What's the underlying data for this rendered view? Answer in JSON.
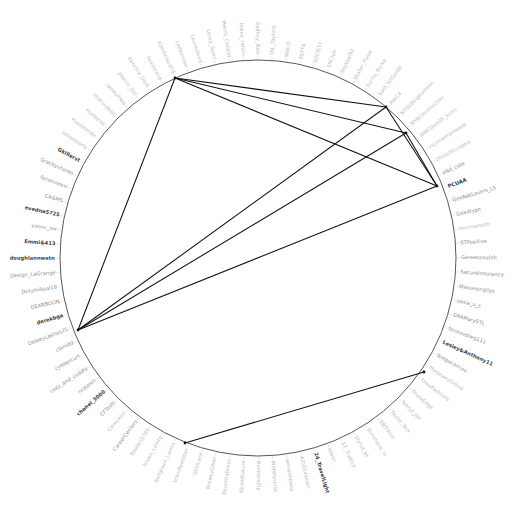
{
  "figure": {
    "type": "circular-network-graph",
    "title": "",
    "center_x": 258,
    "center_y": 258,
    "radius": 198,
    "label_radius": 203,
    "background_color": "#ffffff",
    "ring_color": "#444444",
    "edge_color": "#111111",
    "label_color_faint": "#b9b9b9",
    "label_color_mid": "#8d8d8d",
    "label_color_dark": "#3a3a3a"
  },
  "chart_data": {
    "type": "scatter",
    "title": "",
    "xlabel": "",
    "ylabel": "",
    "layout": "circular node-link diagram with radial node labels",
    "node_count": 88,
    "nodes": [
      {
        "id": 0,
        "label": "TAL_TaylorS",
        "tone": "faint"
      },
      {
        "id": 1,
        "label": "Watch",
        "tone": "faint"
      },
      {
        "id": 2,
        "label": "SOFFA",
        "tone": "faint"
      },
      {
        "id": 3,
        "label": "SOCIETY",
        "tone": "faint"
      },
      {
        "id": 4,
        "label": "SNClub",
        "tone": "faint"
      },
      {
        "id": 5,
        "label": "SkyVaal82",
        "tone": "faint"
      },
      {
        "id": 6,
        "label": "Skater_Pulse",
        "tone": "faint"
      },
      {
        "id": 7,
        "label": "Sarita_Burke",
        "tone": "faint"
      },
      {
        "id": 8,
        "label": "Sam_LOGuide",
        "tone": "faint"
      },
      {
        "id": 9,
        "label": "RWC4",
        "tone": "faint"
      },
      {
        "id": 10,
        "label": "NYSSBinghamton",
        "tone": "faint"
      },
      {
        "id": 11,
        "label": "NYKConstruction",
        "tone": "faint"
      },
      {
        "id": 12,
        "label": "NWCGenith_ksrrs",
        "tone": "faint"
      },
      {
        "id": 13,
        "label": "incomekramwest",
        "tone": "faint"
      },
      {
        "id": 14,
        "label": "OhGolfGuilders",
        "tone": "faint"
      },
      {
        "id": 15,
        "label": "aNd_cute",
        "tone": "mid"
      },
      {
        "id": 16,
        "label": "PCUAA",
        "tone": "dark"
      },
      {
        "id": 17,
        "label": "GeeNatLovers_L5",
        "tone": "mid"
      },
      {
        "id": 18,
        "label": "Geadtypn",
        "tone": "mid"
      },
      {
        "id": 19,
        "label": "mrcrownshlr",
        "tone": "faint"
      },
      {
        "id": 20,
        "label": "STPositive",
        "tone": "mid"
      },
      {
        "id": 21,
        "label": "Gereespayjob",
        "tone": "mid"
      },
      {
        "id": 22,
        "label": "SecureInsurance",
        "tone": "mid"
      },
      {
        "id": 23,
        "label": "Massevingllys",
        "tone": "mid"
      },
      {
        "id": 24,
        "label": "sonia_u_s",
        "tone": "mid"
      },
      {
        "id": 25,
        "label": "GRAMarySTL",
        "tone": "mid"
      },
      {
        "id": 26,
        "label": "formsvdlwg111",
        "tone": "mid"
      },
      {
        "id": 27,
        "label": "Lesley&Anthony11",
        "tone": "dark"
      },
      {
        "id": 28,
        "label": "Temperances",
        "tone": "mid"
      },
      {
        "id": 29,
        "label": "TheseaeyGroup",
        "tone": "faint"
      },
      {
        "id": 30,
        "label": "TheeFashions",
        "tone": "faint"
      },
      {
        "id": 31,
        "label": "ThalaEdge",
        "tone": "faint"
      },
      {
        "id": 32,
        "label": "Tehryl_Jan",
        "tone": "faint"
      },
      {
        "id": 33,
        "label": "Taylor_Bux",
        "tone": "faint"
      },
      {
        "id": 34,
        "label": "SWTdsss",
        "tone": "faint"
      },
      {
        "id": 35,
        "label": "Sunshyne_ts",
        "tone": "faint"
      },
      {
        "id": 36,
        "label": "Stylist_bt",
        "tone": "faint"
      },
      {
        "id": 37,
        "label": "ST_Traffick",
        "tone": "faint"
      },
      {
        "id": 38,
        "label": "ssbsn_",
        "tone": "faint"
      },
      {
        "id": 39,
        "label": "24_TravelLight",
        "tone": "dark"
      },
      {
        "id": 40,
        "label": "AZsOutwhen",
        "tone": "faint"
      },
      {
        "id": 41,
        "label": "wevenflowss",
        "tone": "faint"
      },
      {
        "id": 42,
        "label": "WSMPeterSt",
        "tone": "faint"
      },
      {
        "id": 43,
        "label": "BelmoreZip",
        "tone": "faint"
      },
      {
        "id": 44,
        "label": "BirdieNature",
        "tone": "faint"
      },
      {
        "id": 45,
        "label": "BlueVitaDress",
        "tone": "faint"
      },
      {
        "id": 46,
        "label": "BrewsyOlson",
        "tone": "faint"
      },
      {
        "id": 47,
        "label": "GlitzLara",
        "tone": "faint"
      },
      {
        "id": 48,
        "label": "brandlywilden",
        "tone": "faint"
      },
      {
        "id": 49,
        "label": "Bellgreen_Lamto",
        "tone": "faint"
      },
      {
        "id": 50,
        "label": "breen_Lamto",
        "tone": "faint"
      },
      {
        "id": 51,
        "label": "BowlerQ709",
        "tone": "faint"
      },
      {
        "id": 52,
        "label": "CareerCenters",
        "tone": "mid"
      },
      {
        "id": 53,
        "label": "Careyelrri",
        "tone": "faint"
      },
      {
        "id": 54,
        "label": "CFTools",
        "tone": "mid"
      },
      {
        "id": 55,
        "label": "chanel_3000",
        "tone": "dark"
      },
      {
        "id": 56,
        "label": "ncdaren",
        "tone": "mid"
      },
      {
        "id": 57,
        "label": "cozy_and_cuddly",
        "tone": "mid"
      },
      {
        "id": 58,
        "label": "cybbercurt",
        "tone": "mid"
      },
      {
        "id": 59,
        "label": "ctanidd",
        "tone": "mid"
      },
      {
        "id": 60,
        "label": "DeleeyLashes25",
        "tone": "mid"
      },
      {
        "id": 61,
        "label": "derekbga",
        "tone": "dark"
      },
      {
        "id": 62,
        "label": "DEARBOON",
        "tone": "mid"
      },
      {
        "id": 63,
        "label": "Dotymikaal19",
        "tone": "mid"
      },
      {
        "id": 64,
        "label": "Design_LaGrange",
        "tone": "mid"
      },
      {
        "id": 65,
        "label": "doughlannwatn",
        "tone": "dark"
      },
      {
        "id": 66,
        "label": "Emmi&413",
        "tone": "dark"
      },
      {
        "id": 67,
        "label": "evonc_lex",
        "tone": "mid"
      },
      {
        "id": 68,
        "label": "evedna5725",
        "tone": "dark"
      },
      {
        "id": 69,
        "label": "CA&M5",
        "tone": "mid"
      },
      {
        "id": 70,
        "label": "feralnnoxxi",
        "tone": "mid"
      },
      {
        "id": 71,
        "label": "Graceyvhores",
        "tone": "mid"
      },
      {
        "id": 72,
        "label": "Gkillerst",
        "tone": "dark"
      },
      {
        "id": 73,
        "label": "Hillsmoorte",
        "tone": "faint"
      },
      {
        "id": 74,
        "label": "HooInlande",
        "tone": "faint"
      },
      {
        "id": 75,
        "label": "Hunteroo",
        "tone": "faint"
      },
      {
        "id": 76,
        "label": "Irrotovdear",
        "tone": "faint"
      },
      {
        "id": 77,
        "label": "JamesPMw",
        "tone": "faint"
      },
      {
        "id": 78,
        "label": "JHarris_Qet",
        "tone": "faint"
      },
      {
        "id": 79,
        "label": "Kanchia_Oerk",
        "tone": "faint"
      },
      {
        "id": 80,
        "label": "kevinvaxd",
        "tone": "faint"
      },
      {
        "id": 81,
        "label": "Kombcloud78",
        "tone": "faint"
      },
      {
        "id": 82,
        "label": "Ladesmaer",
        "tone": "faint"
      },
      {
        "id": 83,
        "label": "LaurasNord",
        "tone": "faint"
      },
      {
        "id": 84,
        "label": "Leroy_Sushi",
        "tone": "faint"
      },
      {
        "id": 85,
        "label": "Merris_ChOOd",
        "tone": "faint"
      },
      {
        "id": 86,
        "label": "Mikee_rahim",
        "tone": "faint"
      },
      {
        "id": 87,
        "label": "Sydney_Bale",
        "tone": "faint"
      }
    ],
    "hub_nodes": [
      {
        "name": "top-hub",
        "x": 175,
        "y": 78
      },
      {
        "name": "left-hub",
        "x": 78,
        "y": 330
      },
      {
        "name": "right-hub",
        "x": 437,
        "y": 186
      },
      {
        "name": "upper-right-a",
        "x": 386,
        "y": 107
      },
      {
        "name": "upper-right-b",
        "x": 406,
        "y": 133
      },
      {
        "name": "bottom-hub",
        "x": 185,
        "y": 443
      },
      {
        "name": "lower-right",
        "x": 424,
        "y": 372
      }
    ],
    "edges": [
      {
        "from": "top-hub",
        "to": "left-hub"
      },
      {
        "from": "top-hub",
        "to": "right-hub"
      },
      {
        "from": "top-hub",
        "to": "upper-right-a"
      },
      {
        "from": "top-hub",
        "to": "upper-right-b"
      },
      {
        "from": "left-hub",
        "to": "right-hub"
      },
      {
        "from": "left-hub",
        "to": "upper-right-a"
      },
      {
        "from": "left-hub",
        "to": "upper-right-b"
      },
      {
        "from": "upper-right-a",
        "to": "right-hub"
      },
      {
        "from": "upper-right-b",
        "to": "right-hub"
      },
      {
        "from": "bottom-hub",
        "to": "lower-right"
      }
    ]
  }
}
